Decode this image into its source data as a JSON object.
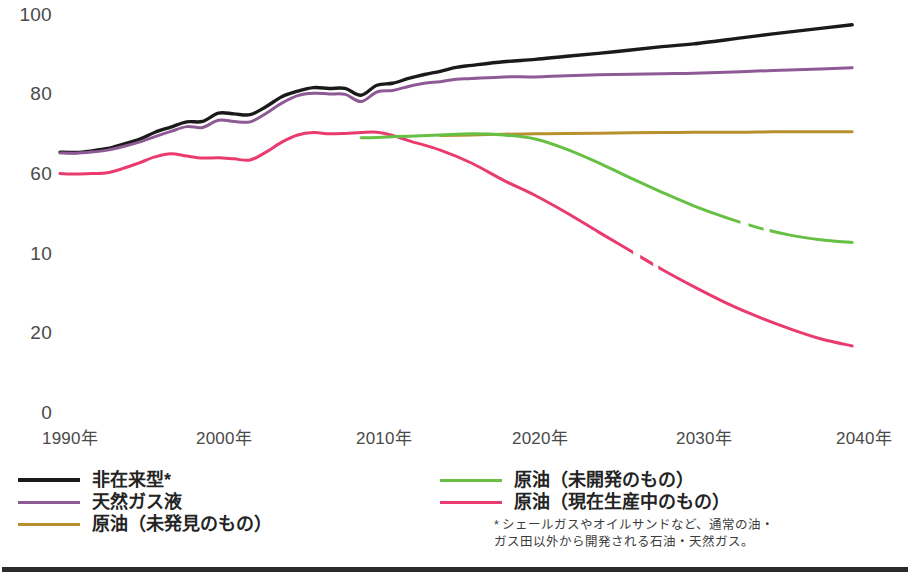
{
  "chart_data": {
    "type": "line",
    "title": "",
    "subtitle": "",
    "xlabel": "",
    "ylabel": "",
    "xlim": [
      1990,
      2041
    ],
    "ylim": [
      0,
      100
    ],
    "grid": false,
    "legend_position": "bottom",
    "y_ticks": [
      {
        "value": 100,
        "label": "100"
      },
      {
        "value": 80,
        "label": "80"
      },
      {
        "value": 60,
        "label": "60"
      },
      {
        "value": 40,
        "label": "10"
      },
      {
        "value": 20,
        "label": "20"
      },
      {
        "value": 0,
        "label": "0"
      }
    ],
    "x_ticks": [
      {
        "value": 1990,
        "label": "1990年"
      },
      {
        "value": 2000,
        "label": "2000年"
      },
      {
        "value": 2010,
        "label": "2010年"
      },
      {
        "value": 2020,
        "label": "2020年"
      },
      {
        "value": 2030,
        "label": "2030年"
      },
      {
        "value": 2040,
        "label": "2040年"
      }
    ],
    "series": [
      {
        "name": "非在来型*",
        "color": "#1a1a1a",
        "x": [
          1990,
          1991,
          1992,
          1993,
          1994,
          1995,
          1996,
          1997,
          1998,
          1999,
          2000,
          2001,
          2002,
          2003,
          2004,
          2005,
          2006,
          2007,
          2008,
          2009,
          2010,
          2011,
          2012,
          2013,
          2014,
          2015,
          2016,
          2018,
          2020,
          2022,
          2025,
          2028,
          2030,
          2033,
          2035,
          2038,
          2040
        ],
        "y": [
          65.3,
          65.2,
          65.6,
          66.2,
          67.3,
          68.5,
          70.3,
          71.6,
          72.9,
          73.0,
          75.1,
          74.9,
          74.7,
          76.7,
          79.2,
          80.6,
          81.5,
          81.3,
          81.3,
          79.6,
          82.1,
          82.6,
          83.8,
          84.8,
          85.6,
          86.6,
          87.1,
          88.0,
          88.6,
          89.4,
          90.5,
          91.8,
          92.5,
          94.0,
          95.0,
          96.4,
          97.3
        ]
      },
      {
        "name": "天然ガス液",
        "color": "#8e5a96",
        "x": [
          1990,
          1991,
          1992,
          1993,
          1994,
          1995,
          1996,
          1997,
          1998,
          1999,
          2000,
          2001,
          2002,
          2003,
          2004,
          2005,
          2006,
          2007,
          2008,
          2009,
          2010,
          2011,
          2012,
          2013,
          2014,
          2015,
          2016,
          2018,
          2020,
          2022,
          2025,
          2028,
          2030,
          2033,
          2035,
          2038,
          2040
        ],
        "y": [
          65.1,
          65.0,
          65.3,
          65.8,
          66.7,
          67.8,
          69.2,
          70.5,
          71.7,
          71.5,
          73.3,
          73.0,
          72.9,
          75.0,
          77.6,
          79.5,
          80.1,
          79.9,
          79.8,
          78.0,
          80.4,
          80.8,
          81.8,
          82.6,
          83.0,
          83.6,
          83.8,
          84.2,
          84.2,
          84.5,
          84.8,
          85.0,
          85.1,
          85.5,
          85.8,
          86.2,
          86.5
        ]
      },
      {
        "name": "原油（未発見のもの）",
        "color": "#b8902f",
        "x": [
          2014,
          2016,
          2018,
          2020,
          2022,
          2025,
          2028,
          2030,
          2033,
          2035,
          2038,
          2040
        ],
        "y": [
          69.5,
          69.6,
          69.8,
          69.9,
          70.0,
          70.1,
          70.2,
          70.3,
          70.3,
          70.4,
          70.4,
          70.4
        ],
        "note": "line begins mid-chart (projection only)"
      },
      {
        "name": "原油（未開発のもの）",
        "color": "#66c044",
        "x": [
          2009,
          2010,
          2012,
          2014,
          2016,
          2018,
          2020,
          2022,
          2024,
          2026,
          2028,
          2030,
          2032,
          2034,
          2036,
          2038,
          2040
        ],
        "y": [
          68.9,
          69.0,
          69.3,
          69.6,
          69.9,
          69.6,
          68.6,
          66.0,
          62.6,
          58.8,
          55.2,
          51.8,
          48.9,
          46.4,
          44.5,
          43.3,
          42.6
        ],
        "note": "dashed gap near 2033-2035"
      },
      {
        "name": "原油（現在生産中のもの）",
        "color": "#ea3b6e",
        "x": [
          1990,
          1991,
          1992,
          1993,
          1994,
          1995,
          1996,
          1997,
          1998,
          1999,
          2000,
          2001,
          2002,
          2003,
          2004,
          2005,
          2006,
          2007,
          2008,
          2009,
          2010,
          2011,
          2012,
          2014,
          2016,
          2018,
          2020,
          2022,
          2024,
          2026,
          2028,
          2030,
          2032,
          2034,
          2036,
          2038,
          2040
        ],
        "y": [
          59.9,
          59.8,
          59.9,
          60.1,
          61.2,
          62.6,
          64.1,
          64.9,
          64.3,
          63.8,
          63.9,
          63.6,
          63.3,
          65.3,
          67.8,
          69.6,
          70.2,
          69.9,
          70.0,
          70.2,
          70.3,
          69.5,
          68.2,
          65.8,
          62.5,
          58.2,
          54.4,
          50.0,
          45.2,
          40.5,
          35.8,
          31.5,
          27.5,
          24.0,
          21.0,
          18.4,
          16.6
        ],
        "note": "dashed gap near 2026-2028"
      }
    ]
  },
  "legend": {
    "left_items": [
      {
        "label": "非在来型*",
        "color": "#1a1a1a"
      },
      {
        "label": "天然ガス液",
        "color": "#8e5a96"
      },
      {
        "label": "原油（未発見のもの）",
        "color": "#b8902f"
      }
    ],
    "right_items": [
      {
        "label": "原油（未開発のもの）",
        "color": "#66c044"
      },
      {
        "label": "原油（現在生産中のもの）",
        "color": "#ea3b6e"
      }
    ]
  },
  "footnote": {
    "line1": "* シェールガスやオイルサンドなど、通常の油・",
    "line2": "ガス田以外から開発される石油・天然ガス。"
  }
}
